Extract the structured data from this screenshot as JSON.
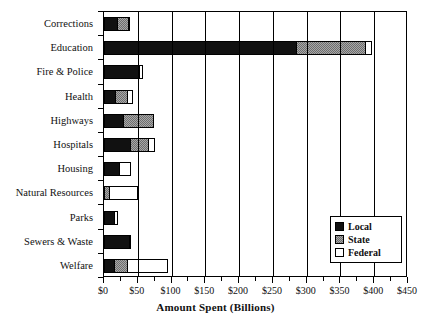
{
  "chart_data": {
    "type": "bar",
    "orientation": "horizontal",
    "stacked": true,
    "title": "",
    "xlabel": "Amount Spent (Billions)",
    "ylabel": "",
    "xlim": [
      0,
      450
    ],
    "xtick_labels": [
      "$0",
      "$50",
      "$100",
      "$150",
      "$200",
      "$250",
      "$300",
      "$350",
      "$400",
      "$450"
    ],
    "xtick_values": [
      0,
      50,
      100,
      150,
      200,
      250,
      300,
      350,
      400,
      450
    ],
    "xtick_minor_step": 25,
    "grid": "vertical",
    "legend_position": "inside-lower-right",
    "categories": [
      "Corrections",
      "Education",
      "Fire &  Police",
      "Health",
      "Highways",
      "Hospitals",
      "Housing",
      "Natural Resources",
      "Parks",
      "Sewers & Waste",
      "Welfare"
    ],
    "series": [
      {
        "name": "Local",
        "color": "#111111",
        "values": [
          20,
          285,
          52,
          18,
          29,
          40,
          24,
          0,
          17,
          38,
          16
        ]
      },
      {
        "name": "State",
        "color": "#a8a8a8",
        "values": [
          18,
          105,
          3,
          19,
          47,
          28,
          0,
          9,
          0,
          4,
          21
        ]
      },
      {
        "name": "Federal",
        "color": "#ffffff",
        "values": [
          1,
          10,
          5,
          9,
          0,
          10,
          18,
          43,
          5,
          0,
          61
        ]
      }
    ],
    "totals": [
      39,
      400,
      60,
      46,
      76,
      78,
      42,
      52,
      22,
      42,
      98
    ]
  },
  "legend": {
    "items": [
      {
        "label": "Local",
        "swatch": "local"
      },
      {
        "label": "State",
        "swatch": "state"
      },
      {
        "label": "Federal",
        "swatch": "federal"
      }
    ]
  }
}
